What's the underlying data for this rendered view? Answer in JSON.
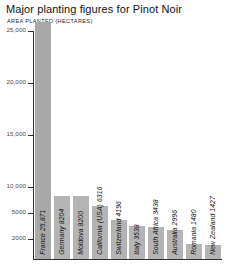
{
  "chart_data": {
    "type": "bar",
    "title": "Major planting figures for Pinot Noir",
    "subtitle": "AREA PLANTED (HECTARES)",
    "xlabel": "",
    "ylabel": "AREA PLANTED (HECTARES)",
    "orientation": "vertical",
    "grid": false,
    "legend": null,
    "axis_note": "y-axis is non-linear below 10,000: ticks 5000 and 2000 are compressed toward the baseline",
    "ytick_labels": [
      "25,000",
      "20,000",
      "15,000",
      "10,000",
      "5000",
      "2000"
    ],
    "ytick_values": [
      25000,
      20000,
      15000,
      10000,
      5000,
      2000
    ],
    "ylim": [
      0,
      26500
    ],
    "categories": [
      "France",
      "Germany",
      "Moldova",
      "California (USA)",
      "Switzerland",
      "Italy",
      "South Africa",
      "Australia",
      "Romania",
      "New Zealand"
    ],
    "values": [
      25871,
      8204,
      8200,
      6316,
      4196,
      3538,
      3438,
      2996,
      1480,
      1427
    ],
    "bar_labels": [
      "France 25,871",
      "Germany 8204",
      "Moldova 8200",
      "California (USA) 6316",
      "Switzerland 4196",
      "Italy 3538",
      "South Africa 3438",
      "Australia 2996",
      "Romania 1480",
      "New Zealand 1427"
    ],
    "colors": {
      "bar_fill": "#b4b4b4",
      "bar_fill_first": "#a8a8a8",
      "axis": "#2e2e2e",
      "tick_label": "#4a4a4a",
      "title": "#111111",
      "background": "#ffffff"
    }
  }
}
